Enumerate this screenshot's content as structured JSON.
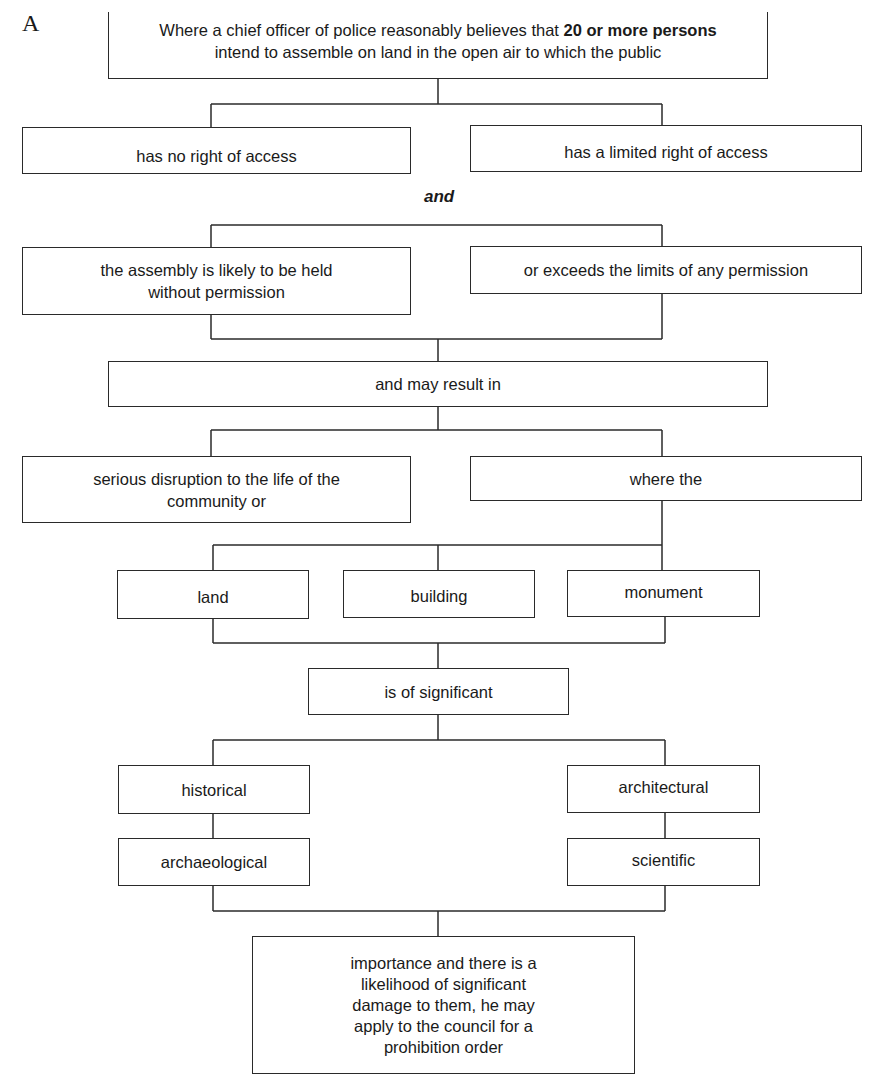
{
  "figure_label": "A",
  "root": {
    "text_before_bold": "Where a chief officer of police reasonably believes that ",
    "text_bold": "20 or more persons",
    "text_line2": "intend to assemble on land in the open air to which the public"
  },
  "access": {
    "left": "has no right of access",
    "right": "has a limited right of access"
  },
  "connector_and": "and",
  "permission": {
    "left": "the assembly is likely to be held without permission",
    "right": "or exceeds the limits of any permission"
  },
  "result": "and may result in",
  "consequence": {
    "left": "serious disruption to the life of the community or",
    "right": "where the"
  },
  "places": [
    "land",
    "building",
    "monument"
  ],
  "significance": "is of significant",
  "types": {
    "left_top": "historical",
    "left_bottom": "archaeological",
    "right_top": "architectural",
    "right_bottom": "scientific"
  },
  "conclusion": "importance and there is a likelihood of significant damage to them, he may apply to the council for a prohibition order"
}
